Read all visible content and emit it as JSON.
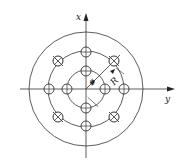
{
  "diagram": {
    "type": "bolt-hole pattern (concentric circles with holes)",
    "center": [
      86,
      89
    ],
    "axes": {
      "x_label": "x",
      "y_label": "y"
    },
    "circles": {
      "outer_radius": 57,
      "middle_radius": 38,
      "inner_radius": 19
    },
    "dimensions": {
      "diameter_label": "ø",
      "radius_label": "R"
    },
    "holes": {
      "radius": 5,
      "plain_crossed": [
        {
          "x": 86,
          "y": 52
        },
        {
          "x": 86,
          "y": 71
        },
        {
          "x": 86,
          "y": 108
        },
        {
          "x": 86,
          "y": 126
        },
        {
          "x": 49,
          "y": 89
        },
        {
          "x": 67,
          "y": 89
        },
        {
          "x": 105,
          "y": 89
        },
        {
          "x": 124,
          "y": 89
        }
      ],
      "diagonal_crossed": [
        {
          "x": 58,
          "y": 61
        },
        {
          "x": 114,
          "y": 61
        },
        {
          "x": 58,
          "y": 117
        },
        {
          "x": 114,
          "y": 117
        }
      ]
    },
    "colors": {
      "line": "#333333",
      "background": "#ffffff"
    }
  }
}
